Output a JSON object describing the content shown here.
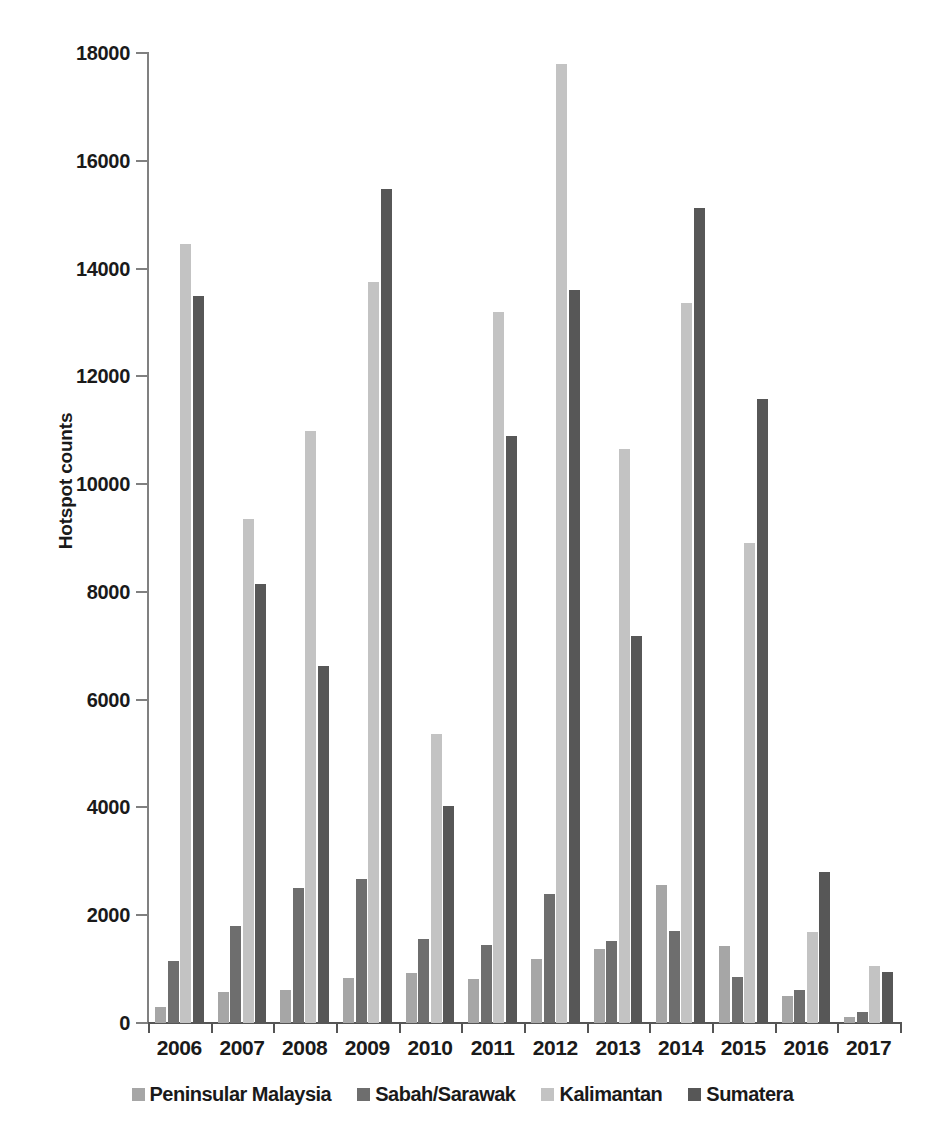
{
  "top_caption": "",
  "chart_data": {
    "type": "bar",
    "title": "",
    "subtitle": "",
    "xlabel": "",
    "ylabel": "Hotspot counts",
    "ylim": [
      0,
      18000
    ],
    "ytick_step": 2000,
    "yticks": [
      "0",
      "2000",
      "4000",
      "6000",
      "8000",
      "10000",
      "12000",
      "14000",
      "16000",
      "18000"
    ],
    "ytick_values": [
      0,
      2000,
      4000,
      6000,
      8000,
      10000,
      12000,
      14000,
      16000,
      18000
    ],
    "grid": false,
    "legend_position": "bottom",
    "categories": [
      "2006",
      "2007",
      "2008",
      "2009",
      "2010",
      "2011",
      "2012",
      "2013",
      "2014",
      "2015",
      "2016",
      "2017"
    ],
    "series": [
      {
        "name": "Peninsular Malaysia",
        "color": "#a6a6a6",
        "values": [
          300,
          570,
          620,
          830,
          920,
          820,
          1190,
          1380,
          2560,
          1420,
          510,
          120
        ]
      },
      {
        "name": "Sabah/Sarawak",
        "color": "#6e6e6e",
        "values": [
          1150,
          1800,
          2510,
          2680,
          1560,
          1450,
          2390,
          1520,
          1700,
          860,
          610,
          210
        ]
      },
      {
        "name": "Kalimantan",
        "color": "#c3c3c3",
        "values": [
          14450,
          9350,
          10980,
          13750,
          5370,
          13200,
          17800,
          10660,
          13360,
          8900,
          1680,
          1060
        ]
      },
      {
        "name": "Sumatera",
        "color": "#575757",
        "values": [
          13500,
          8150,
          6620,
          15470,
          4020,
          10890,
          13600,
          7180,
          15120,
          11580,
          2800,
          950
        ]
      }
    ]
  }
}
